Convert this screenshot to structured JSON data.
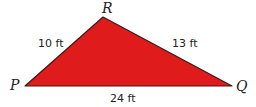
{
  "diagram": {
    "type": "triangle",
    "fill_color": "#e01b1b",
    "stroke_color": "#3a1a1a",
    "vertices": {
      "P": {
        "label": "P"
      },
      "Q": {
        "label": "Q"
      },
      "R": {
        "label": "R"
      }
    },
    "sides": {
      "PR": {
        "label": "10 ft"
      },
      "RQ": {
        "label": "13 ft"
      },
      "PQ": {
        "label": "24 ft"
      }
    }
  }
}
